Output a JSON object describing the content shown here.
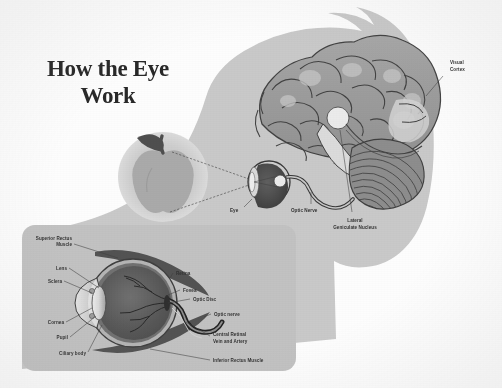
{
  "poster": {
    "title_line1": "How the Eye",
    "title_line2": "Work",
    "background_color": "#fdfdfd",
    "head_silhouette_color": "#c9c9c9",
    "brain_color": "#9b9b9b",
    "panel_color": "#c2c2c2",
    "label_color": "#2e2e2e"
  },
  "brain_diagram": {
    "labels": {
      "visual_cortex_line1": "Visual",
      "visual_cortex_line2": "Cortex",
      "eye": "Eye",
      "optic_nerve": "Optic Nerve",
      "lgn_line1": "Lateral",
      "lgn_line2": "Geniculate Nucleus"
    },
    "stimulus_object": "apple"
  },
  "eye_anatomy_panel": {
    "labels": {
      "superior_rectus_line1": "Superior Rectus",
      "superior_rectus_line2": "Muscle",
      "lens": "Lens",
      "sclera": "Sclera",
      "cornea": "Cornea",
      "pupil": "Pupil",
      "ciliary_body": "Ciliary body",
      "retina": "Retina",
      "fovea": "Fovea",
      "optic_disc": "Optic Disc",
      "optic_nerve": "Optic nerve",
      "central_retinal_line1": "Central Retinal",
      "central_retinal_line2": "Vein and Artery",
      "inferior_rectus": "Inferior Rectus Muscle"
    }
  }
}
